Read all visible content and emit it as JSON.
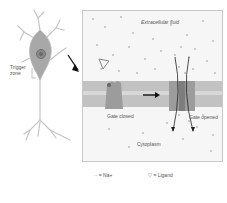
{
  "neuron": {
    "trigger_zone_label_line1": "Trigger",
    "trigger_zone_label_line2": "zone"
  },
  "panel": {
    "extracellular_label": "Extracellular fluid",
    "cytoplasm_label": "Cytoplasm",
    "gate_closed_label": "Gate closed",
    "gate_opened_label": "Gate opened"
  },
  "legend": {
    "sodium_label": "= Na+",
    "ligand_label": "= Ligand"
  },
  "colors": {
    "membrane": "#b9b9b9",
    "channel": "#8f8f8f",
    "dots": "#b0b0b0",
    "neuron": "#a8a8a8"
  }
}
